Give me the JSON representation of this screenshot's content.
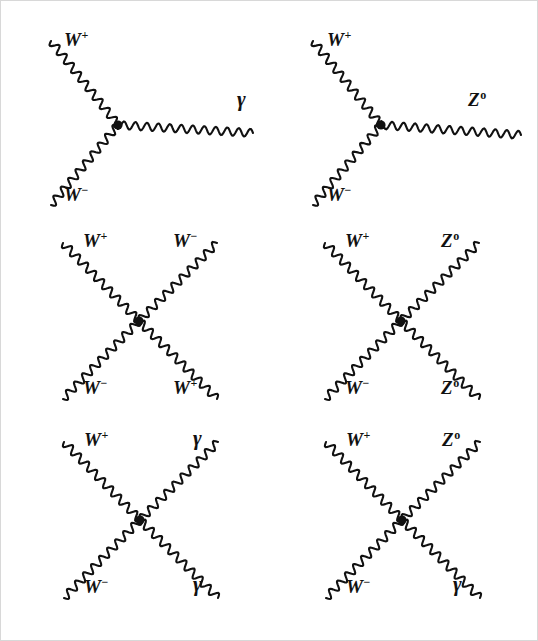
{
  "figure": {
    "background_color": "#ffffff",
    "line_color": "#111111",
    "vertex_color": "#111111"
  },
  "symbols": {
    "w_plus": "W",
    "w_plus_sup": "+",
    "w_minus": "W",
    "w_minus_sup": "−",
    "z_zero": "Z",
    "z_zero_sup": "o",
    "photon": "γ"
  },
  "diagrams": [
    {
      "id": "diagram-1",
      "name": "wwg-triple-vertex",
      "type": "triple-vertex",
      "row": 1,
      "column": 1,
      "vertex": {
        "x": 117,
        "y": 124
      },
      "legs": [
        {
          "name": "leg-w-plus-in",
          "particle": "W+",
          "label": "W",
          "sup": "+",
          "end": {
            "x": 50,
            "y": 40
          },
          "label_pos": {
            "x": 63,
            "y": 28
          }
        },
        {
          "name": "leg-w-minus-in",
          "particle": "W-",
          "label": "W",
          "sup": "−",
          "end": {
            "x": 50,
            "y": 204
          },
          "label_pos": {
            "x": 63,
            "y": 183
          }
        },
        {
          "name": "leg-photon-out",
          "particle": "photon",
          "label": "γ",
          "sup": "",
          "end": {
            "x": 252,
            "y": 132
          },
          "label_pos": {
            "x": 236,
            "y": 88
          }
        }
      ]
    },
    {
      "id": "diagram-2",
      "name": "wwz-triple-vertex",
      "type": "triple-vertex",
      "row": 1,
      "column": 2,
      "vertex": {
        "x": 380,
        "y": 124
      },
      "legs": [
        {
          "name": "leg-w-plus-in",
          "particle": "W+",
          "label": "W",
          "sup": "+",
          "end": {
            "x": 312,
            "y": 40
          },
          "label_pos": {
            "x": 326,
            "y": 28
          }
        },
        {
          "name": "leg-w-minus-in",
          "particle": "W-",
          "label": "W",
          "sup": "−",
          "end": {
            "x": 312,
            "y": 204
          },
          "label_pos": {
            "x": 326,
            "y": 183
          }
        },
        {
          "name": "leg-z-out",
          "particle": "Z0",
          "label": "Z",
          "sup": "o",
          "end": {
            "x": 520,
            "y": 134
          },
          "label_pos": {
            "x": 467,
            "y": 88
          }
        }
      ]
    },
    {
      "id": "diagram-3",
      "name": "wwww-quartic-vertex",
      "type": "quartic-vertex",
      "row": 2,
      "column": 1,
      "vertex": {
        "x": 138,
        "y": 320
      },
      "legs": [
        {
          "name": "leg-top-left",
          "particle": "W+",
          "label": "W",
          "sup": "+",
          "end": {
            "x": 62,
            "y": 242
          },
          "label_pos": {
            "x": 82,
            "y": 229
          }
        },
        {
          "name": "leg-top-right",
          "particle": "W-",
          "label": "W",
          "sup": "−",
          "end": {
            "x": 216,
            "y": 242
          },
          "label_pos": {
            "x": 172,
            "y": 229
          }
        },
        {
          "name": "leg-bottom-left",
          "particle": "W-",
          "label": "W",
          "sup": "−",
          "end": {
            "x": 62,
            "y": 398
          },
          "label_pos": {
            "x": 82,
            "y": 376
          }
        },
        {
          "name": "leg-bottom-right",
          "particle": "W+",
          "label": "W",
          "sup": "+",
          "end": {
            "x": 216,
            "y": 398
          },
          "label_pos": {
            "x": 172,
            "y": 376
          }
        }
      ]
    },
    {
      "id": "diagram-4",
      "name": "wwzz-quartic-vertex",
      "type": "quartic-vertex",
      "row": 2,
      "column": 2,
      "vertex": {
        "x": 400,
        "y": 320
      },
      "legs": [
        {
          "name": "leg-top-left",
          "particle": "W+",
          "label": "W",
          "sup": "+",
          "end": {
            "x": 324,
            "y": 242
          },
          "label_pos": {
            "x": 344,
            "y": 229
          }
        },
        {
          "name": "leg-top-right",
          "particle": "Z0",
          "label": "Z",
          "sup": "o",
          "end": {
            "x": 478,
            "y": 242
          },
          "label_pos": {
            "x": 440,
            "y": 229
          }
        },
        {
          "name": "leg-bottom-left",
          "particle": "W-",
          "label": "W",
          "sup": "−",
          "end": {
            "x": 324,
            "y": 398
          },
          "label_pos": {
            "x": 344,
            "y": 376
          }
        },
        {
          "name": "leg-bottom-right",
          "particle": "Z0",
          "label": "Z",
          "sup": "o",
          "end": {
            "x": 478,
            "y": 398
          },
          "label_pos": {
            "x": 440,
            "y": 376
          }
        }
      ]
    },
    {
      "id": "diagram-5",
      "name": "wwgg-quartic-vertex",
      "type": "quartic-vertex",
      "row": 3,
      "column": 1,
      "vertex": {
        "x": 139,
        "y": 519
      },
      "legs": [
        {
          "name": "leg-top-left",
          "particle": "W+",
          "label": "W",
          "sup": "+",
          "end": {
            "x": 63,
            "y": 441
          },
          "label_pos": {
            "x": 83,
            "y": 428
          }
        },
        {
          "name": "leg-top-right",
          "particle": "photon",
          "label": "γ",
          "sup": "",
          "end": {
            "x": 217,
            "y": 441
          },
          "label_pos": {
            "x": 192,
            "y": 427
          }
        },
        {
          "name": "leg-bottom-left",
          "particle": "W-",
          "label": "W",
          "sup": "−",
          "end": {
            "x": 63,
            "y": 597
          },
          "label_pos": {
            "x": 83,
            "y": 575
          }
        },
        {
          "name": "leg-bottom-right",
          "particle": "photon",
          "label": "γ",
          "sup": "",
          "end": {
            "x": 217,
            "y": 597
          },
          "label_pos": {
            "x": 192,
            "y": 573
          }
        }
      ]
    },
    {
      "id": "diagram-6",
      "name": "wwzg-quartic-vertex",
      "type": "quartic-vertex",
      "row": 3,
      "column": 2,
      "vertex": {
        "x": 401,
        "y": 519
      },
      "legs": [
        {
          "name": "leg-top-left",
          "particle": "W+",
          "label": "W",
          "sup": "+",
          "end": {
            "x": 325,
            "y": 441
          },
          "label_pos": {
            "x": 345,
            "y": 428
          }
        },
        {
          "name": "leg-top-right",
          "particle": "Z0",
          "label": "Z",
          "sup": "o",
          "end": {
            "x": 479,
            "y": 441
          },
          "label_pos": {
            "x": 441,
            "y": 428
          }
        },
        {
          "name": "leg-bottom-left",
          "particle": "W-",
          "label": "W",
          "sup": "−",
          "end": {
            "x": 325,
            "y": 597
          },
          "label_pos": {
            "x": 345,
            "y": 575
          }
        },
        {
          "name": "leg-bottom-right",
          "particle": "photon",
          "label": "γ",
          "sup": "",
          "end": {
            "x": 479,
            "y": 597
          },
          "label_pos": {
            "x": 452,
            "y": 573
          }
        }
      ]
    }
  ],
  "wave": {
    "amplitude": 4.0,
    "wavelength": 11.5,
    "vertex_radius": 4.6,
    "stroke_width": 2.1
  }
}
